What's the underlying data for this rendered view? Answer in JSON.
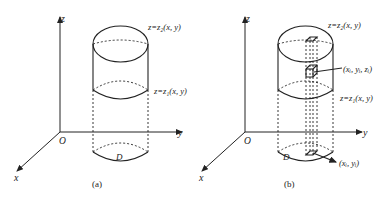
{
  "figure_a": {
    "caption": "(a)",
    "axis_z": "z",
    "axis_y": "y",
    "axis_x": "x",
    "origin": "O",
    "top_surface_label": "z=z₂(x, y)",
    "bottom_surface_label": "z=z₁(x, y)",
    "region_label": "D"
  },
  "figure_b": {
    "caption": "(b)",
    "axis_z": "z",
    "axis_y": "y",
    "axis_x": "x",
    "origin": "O",
    "top_surface_label": "z=z₂(x, y)",
    "bottom_surface_label": "z=z₁(x, y)",
    "region_label": "D",
    "point_label": "(xᵢ, yᵢ, zᵢ)",
    "base_point_label": "(xᵢ, yᵢ)"
  },
  "colors": {
    "stroke": "#222222",
    "background": "#ffffff"
  }
}
